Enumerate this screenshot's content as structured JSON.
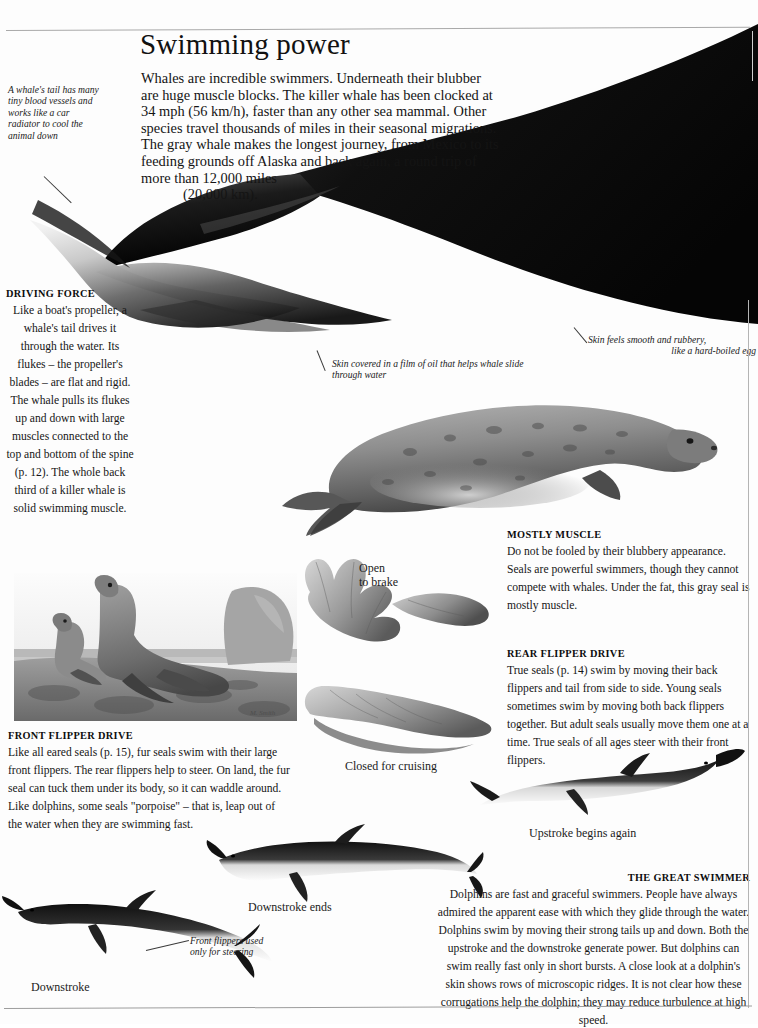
{
  "page": {
    "title": "Swimming power",
    "intro_lines": [
      "Whales are incredible swimmers. Underneath their blubber",
      "are huge muscle blocks. The killer whale has been clocked at",
      "34 mph (56 km/h), faster than any other sea mammal.",
      "Other species travel thousands of miles in their",
      "seasonal migrations. The gray whale makes the",
      "longest journey, from Mexico to its feeding",
      "grounds off Alaska and back again, a",
      "round trip of more than 12,000 miles"
    ],
    "intro_last_line": "(20,000 km)."
  },
  "notes": {
    "whale_tail": "A whale's tail has many tiny blood vessels and works like a car radiator to cool the animal down",
    "oil_film": "Skin covered in a film of oil that helps whale slide through water",
    "rubbery_skin_line1": "Skin feels smooth and rubbery,",
    "rubbery_skin_line2": "like a hard-boiled egg",
    "front_flippers_line1": "Front flippers used",
    "front_flippers_line2": "only for steering"
  },
  "labels": {
    "open_line1": "Open",
    "open_line2": "to brake",
    "closed": "Closed for cruising",
    "upstroke": "Upstroke begins again",
    "downstroke_ends": "Downstroke ends",
    "downstroke": "Downstroke"
  },
  "sections": {
    "driving_force": {
      "heading": "DRIVING FORCE",
      "body": "Like a boat's propeller, a whale's tail drives it through the water. Its flukes – the propeller's blades – are flat and rigid. The whale pulls its flukes up and down with large muscles connected to the top and bottom of the spine (p. 12). The whole back third of a killer whale is solid swimming muscle."
    },
    "mostly_muscle": {
      "heading": "MOSTLY MUSCLE",
      "body": "Do not be fooled by their blubbery appearance. Seals are powerful swimmers, though they cannot compete with whales. Under the fat, this gray seal is mostly muscle."
    },
    "rear_flipper_drive": {
      "heading": "REAR FLIPPER DRIVE",
      "body": "True seals (p. 14) swim by moving their back flippers and tail from side to side. Young seals sometimes swim by moving both back flippers together. But adult seals usually move them one at a time. True seals of all ages steer with their front flippers."
    },
    "front_flipper_drive": {
      "heading": "FRONT FLIPPER DRIVE",
      "body": "Like all eared seals (p. 15), fur seals swim with their large front flippers. The rear flippers help to steer. On land, the fur seal can tuck them under its body, so it can waddle around. Like dolphins, some seals \"porpoise\" – that is, leap out of the water when they are swimming fast."
    },
    "great_swimmer": {
      "heading": "THE GREAT SWIMMER",
      "body": "Dolphins are fast and graceful swimmers. People have always admired the apparent ease with which they glide through the water. Dolphins swim by moving their strong tails up and down. Both the upstroke and the downstroke generate power. But dolphins can swim really fast only in short bursts. A close look at a dolphin's skin shows rows of microscopic ridges. It is not clear how these corrugations help the dolphin; they may reduce turbulence at high speed."
    }
  },
  "colors": {
    "page_background": "#fdfdfd",
    "text": "#1a1a1a",
    "rule": "#a9a9a9",
    "whale_dark": "#0a0a0a",
    "seal_gray": "#8f8f8f"
  }
}
